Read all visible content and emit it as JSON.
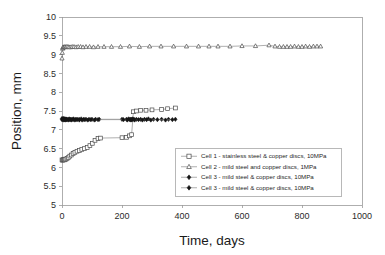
{
  "chart_data": {
    "type": "line",
    "title": "",
    "xlabel": "Time, days",
    "ylabel": "Position, mm",
    "xlim": [
      0,
      1000
    ],
    "ylim": [
      5,
      10
    ],
    "xticks": [
      0,
      200,
      400,
      600,
      800,
      1000
    ],
    "yticks": [
      5,
      5.5,
      6,
      6.5,
      7,
      7.5,
      8,
      8.5,
      9,
      9.5,
      10
    ],
    "xtick_labels": [
      "0",
      "200",
      "400",
      "600",
      "800",
      "1000"
    ],
    "ytick_labels": [
      "5",
      "5.5",
      "6",
      "6.5",
      "7",
      "7.5",
      "8",
      "8.5",
      "9",
      "9.5",
      "10"
    ],
    "grid": false,
    "legend_position": "lower-right-inside",
    "series": [
      {
        "name": "Cell 1 - stainless steel & copper discs, 10MPa",
        "marker": "open-square",
        "marker_filled": false,
        "x": [
          0,
          2,
          4,
          6,
          8,
          10,
          13,
          17,
          21,
          26,
          31,
          37,
          43,
          50,
          58,
          66,
          75,
          84,
          93,
          101,
          110,
          120,
          128,
          200,
          215,
          225,
          232,
          238,
          248,
          262,
          280,
          300,
          332,
          352,
          378
        ],
        "y": [
          6.2,
          6.19,
          6.2,
          6.21,
          6.2,
          6.22,
          6.22,
          6.24,
          6.26,
          6.3,
          6.33,
          6.37,
          6.4,
          6.43,
          6.45,
          6.48,
          6.5,
          6.53,
          6.58,
          6.64,
          6.72,
          6.77,
          6.78,
          6.79,
          6.8,
          6.84,
          6.87,
          7.48,
          7.5,
          7.52,
          7.52,
          7.53,
          7.54,
          7.56,
          7.58
        ]
      },
      {
        "name": "Cell 2  - mild steel and copper discs, 1MPa",
        "marker": "open-triangle",
        "marker_filled": false,
        "x": [
          0,
          1,
          2,
          3,
          4,
          6,
          8,
          10,
          13,
          16,
          20,
          24,
          29,
          34,
          40,
          47,
          54,
          62,
          70,
          80,
          92,
          105,
          120,
          140,
          165,
          195,
          225,
          258,
          292,
          330,
          372,
          415,
          455,
          490,
          520,
          560,
          600,
          645,
          690,
          710,
          725,
          738,
          750,
          762,
          775,
          788,
          800,
          812,
          825,
          838,
          850,
          862
        ],
        "y": [
          8.9,
          9.05,
          9.16,
          9.19,
          9.2,
          9.2,
          9.2,
          9.21,
          9.2,
          9.21,
          9.21,
          9.2,
          9.2,
          9.21,
          9.21,
          9.2,
          9.21,
          9.21,
          9.2,
          9.21,
          9.21,
          9.2,
          9.21,
          9.21,
          9.21,
          9.21,
          9.22,
          9.21,
          9.22,
          9.22,
          9.22,
          9.22,
          9.22,
          9.22,
          9.22,
          9.22,
          9.23,
          9.23,
          9.25,
          9.22,
          9.21,
          9.21,
          9.21,
          9.21,
          9.22,
          9.21,
          9.21,
          9.22,
          9.21,
          9.22,
          9.22,
          9.22
        ]
      },
      {
        "name": "Cell 3 - mild steel & copper discs, 10MPa",
        "marker": "filled-diamond",
        "marker_filled": true,
        "x": [
          0,
          2,
          4,
          6,
          8,
          10,
          13,
          16,
          20,
          24,
          28,
          33,
          38,
          44,
          50,
          57,
          64,
          72,
          80,
          90,
          100,
          112,
          124,
          200,
          215,
          222,
          228,
          232,
          236,
          240,
          248,
          262,
          275,
          288,
          305,
          332,
          355,
          378
        ],
        "y": [
          7.3,
          7.29,
          7.29,
          7.3,
          7.29,
          7.28,
          7.29,
          7.28,
          7.28,
          7.29,
          7.28,
          7.28,
          7.29,
          7.28,
          7.28,
          7.28,
          7.29,
          7.28,
          7.28,
          7.28,
          7.28,
          7.28,
          7.28,
          7.28,
          7.28,
          7.29,
          7.28,
          7.28,
          7.29,
          7.28,
          7.28,
          7.28,
          7.28,
          7.29,
          7.28,
          7.28,
          7.28,
          7.28
        ]
      },
      {
        "name": "Cell 3 - mild steel & copper discs, 10MPa",
        "marker": "filled-diamond",
        "marker_filled": true,
        "x": [
          0,
          3,
          6,
          9,
          12,
          16,
          21,
          26,
          31,
          37,
          43,
          50,
          58,
          67,
          76,
          86,
          96,
          108,
          120,
          205,
          218,
          226,
          230,
          234,
          242,
          255,
          268,
          282,
          296,
          318,
          345,
          368
        ],
        "y": [
          7.27,
          7.27,
          7.26,
          7.27,
          7.26,
          7.27,
          7.26,
          7.27,
          7.26,
          7.27,
          7.26,
          7.27,
          7.26,
          7.26,
          7.27,
          7.26,
          7.27,
          7.26,
          7.27,
          7.27,
          7.26,
          7.27,
          7.26,
          7.27,
          7.26,
          7.27,
          7.26,
          7.27,
          7.26,
          7.27,
          7.26,
          7.27
        ]
      }
    ]
  },
  "legend": {
    "entries": [
      {
        "label": "Cell 1 - stainless steel & copper discs, 10MPa",
        "marker": "open-square"
      },
      {
        "label": "Cell 2  - mild steel and copper discs, 1MPa",
        "marker": "open-triangle"
      },
      {
        "label": "Cell 3 - mild steel & copper discs, 10MPa",
        "marker": "filled-diamond"
      },
      {
        "label": "Cell 3 - mild steel & copper discs, 10MPa",
        "marker": "filled-diamond"
      }
    ]
  },
  "colors": {
    "axis": "#9a9a9a",
    "line": "#8d8d8d",
    "marker_stroke": "#4a4a4a",
    "marker_fill_open": "#ffffff",
    "marker_fill_solid": "#151515",
    "text": "#1a1a1a",
    "background": "#ffffff"
  }
}
